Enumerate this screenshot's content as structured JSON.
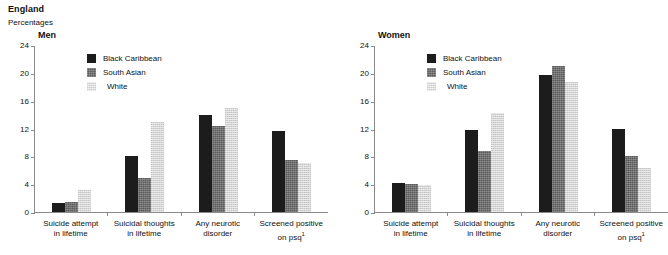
{
  "header": {
    "country": "England",
    "units": "Percentages"
  },
  "panels": [
    {
      "key": "men",
      "title": "Men",
      "legend": [
        "Black Caribbean",
        "South Asian",
        "White"
      ],
      "y_ticks": [
        "24",
        "20",
        "16",
        "12",
        "8",
        "4",
        "0"
      ],
      "x_labels": [
        [
          "Suicide attempt",
          "in lifetime"
        ],
        [
          "Suicidal thoughts",
          "in lifetime"
        ],
        [
          "Any neurotic",
          "disorder"
        ],
        [
          "Screened positive",
          "on psq"
        ]
      ]
    },
    {
      "key": "women",
      "title": "Women",
      "legend": [
        "Black Caribbean",
        "South Asian",
        "White"
      ],
      "y_ticks": [
        "24",
        "20",
        "16",
        "12",
        "8",
        "4",
        "0"
      ],
      "x_labels": [
        [
          "Suicide attempt",
          "in lifetime"
        ],
        [
          "Suicidal thoughts",
          "in lifetime"
        ],
        [
          "Any neurotic",
          "disorder"
        ],
        [
          "Screened positive",
          "on psq"
        ]
      ]
    }
  ],
  "footnote_marker": "1",
  "colors": {
    "black_caribbean": "#1c1c1c",
    "south_asian": "#5a5a5a",
    "white": "#d6d6d6",
    "axis": "#8a8a8a",
    "text": "#111111"
  },
  "chart_data": [
    {
      "type": "bar",
      "title": "Men",
      "subtitle": "England",
      "xlabel": "",
      "ylabel": "Percentages",
      "ylim": [
        0,
        24
      ],
      "yticks": [
        0,
        4,
        8,
        12,
        16,
        20,
        24
      ],
      "grid": false,
      "legend_position": "top-left",
      "categories": [
        "Suicide attempt in lifetime",
        "Suicidal thoughts in lifetime",
        "Any neurotic disorder",
        "Screened positive on psq"
      ],
      "series": [
        {
          "name": "Black Caribbean",
          "values": [
            1.3,
            8.1,
            14.0,
            11.7
          ]
        },
        {
          "name": "South Asian",
          "values": [
            1.4,
            4.9,
            12.4,
            7.5
          ]
        },
        {
          "name": "White",
          "values": [
            3.2,
            13.0,
            15.0,
            7.0
          ]
        }
      ]
    },
    {
      "type": "bar",
      "title": "Women",
      "subtitle": "England",
      "xlabel": "",
      "ylabel": "Percentages",
      "ylim": [
        0,
        24
      ],
      "yticks": [
        0,
        4,
        8,
        12,
        16,
        20,
        24
      ],
      "grid": false,
      "legend_position": "top-left",
      "categories": [
        "Suicide attempt in lifetime",
        "Suicidal thoughts in lifetime",
        "Any neurotic disorder",
        "Screened positive on psq"
      ],
      "series": [
        {
          "name": "Black Caribbean",
          "values": [
            4.1,
            11.8,
            19.7,
            12.0
          ]
        },
        {
          "name": "South Asian",
          "values": [
            4.0,
            8.7,
            21.0,
            8.0
          ]
        },
        {
          "name": "White",
          "values": [
            3.9,
            14.2,
            18.7,
            6.3
          ]
        }
      ]
    }
  ]
}
